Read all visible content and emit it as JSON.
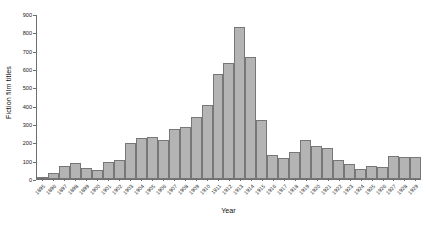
{
  "chart_data": {
    "type": "bar",
    "title": "",
    "xlabel": "Year",
    "ylabel": "Fiction film titles",
    "ylim": [
      0,
      900
    ],
    "yticks": [
      0,
      100,
      200,
      300,
      400,
      500,
      600,
      700,
      800,
      900
    ],
    "grid": false,
    "legend": null,
    "bar_color": "#b4b4b4",
    "bar_edge_color": "#777777",
    "categories": [
      "1895",
      "1896",
      "1897",
      "1898",
      "1899",
      "1900",
      "1901",
      "1902",
      "1903",
      "1904",
      "1905",
      "1906",
      "1907",
      "1908",
      "1909",
      "1910",
      "1911",
      "1912",
      "1913",
      "1914",
      "1915",
      "1916",
      "1917",
      "1918",
      "1919",
      "1920",
      "1921",
      "1922",
      "1923",
      "1924",
      "1925",
      "1926",
      "1927",
      "1928",
      "1929"
    ],
    "values": [
      8,
      32,
      74,
      89,
      60,
      49,
      91,
      102,
      199,
      224,
      230,
      213,
      273,
      288,
      340,
      406,
      577,
      637,
      835,
      670,
      325,
      133,
      113,
      146,
      214,
      180,
      172,
      102,
      81,
      54,
      72,
      66,
      124,
      120,
      120
    ]
  },
  "caption": ""
}
